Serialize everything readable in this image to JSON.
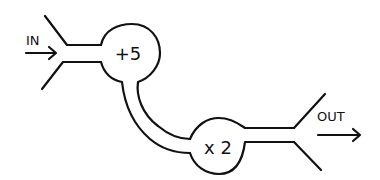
{
  "diagram": {
    "input_label": "IN",
    "output_label": "OUT",
    "nodes": [
      {
        "id": "add",
        "label": "+5"
      },
      {
        "id": "mul",
        "label": "x 2"
      }
    ],
    "edges": [
      {
        "from": "IN",
        "to": "add"
      },
      {
        "from": "add",
        "to": "mul"
      },
      {
        "from": "mul",
        "to": "OUT"
      }
    ],
    "colors": {
      "ink": "#111111",
      "background": "#ffffff"
    }
  }
}
